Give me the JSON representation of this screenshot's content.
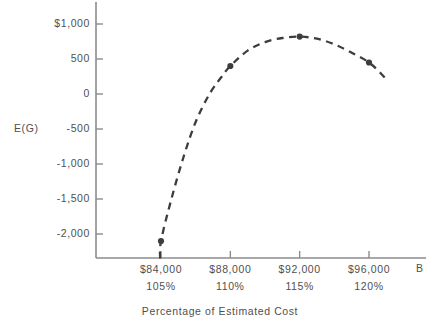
{
  "chart_data": {
    "type": "line",
    "title": "",
    "subtitle": "",
    "xlabel": "Percentage of Estimated Cost",
    "ylabel": "E(G)",
    "x_axis_symbol": "B",
    "grid": false,
    "legend": "none",
    "line_style": "dashed",
    "marker": "filled-circle",
    "xlim": [
      82000,
      98600
    ],
    "ylim": [
      -2350,
      1150
    ],
    "x_ticks": [
      84000,
      88000,
      92000,
      96000
    ],
    "x_tick_labels": [
      "$84,000",
      "$88,000",
      "$92,000",
      "$96,000"
    ],
    "x_tick_sublabels": [
      "105%",
      "110%",
      "115%",
      "120%"
    ],
    "y_ticks": [
      1000,
      500,
      0,
      -500,
      -1000,
      -1500,
      -2000
    ],
    "y_tick_labels": [
      "$1,000",
      "500",
      "0",
      "-500",
      "-1,000",
      "-1,500",
      "-2,000"
    ],
    "x": [
      84000,
      88000,
      92000,
      96000
    ],
    "values": [
      -2100,
      400,
      820,
      450
    ],
    "series": [
      {
        "name": "E(G)",
        "points": [
          {
            "x": 84000,
            "y": -2100,
            "x_label": "$84,000",
            "x_pct": "105%"
          },
          {
            "x": 88000,
            "y": 400,
            "x_label": "$88,000",
            "x_pct": "110%"
          },
          {
            "x": 92000,
            "y": 820,
            "x_label": "$92,000",
            "x_pct": "115%"
          },
          {
            "x": 96000,
            "y": 450,
            "x_label": "$96,000",
            "x_pct": "120%"
          }
        ]
      }
    ],
    "curve_path_points": [
      {
        "x": 83950,
        "y": -2350
      },
      {
        "x": 84000,
        "y": -2100
      },
      {
        "x": 84600,
        "y": -1500
      },
      {
        "x": 85300,
        "y": -900
      },
      {
        "x": 86000,
        "y": -400
      },
      {
        "x": 86800,
        "y": 0
      },
      {
        "x": 87600,
        "y": 280
      },
      {
        "x": 88000,
        "y": 400
      },
      {
        "x": 89000,
        "y": 620
      },
      {
        "x": 90000,
        "y": 740
      },
      {
        "x": 91000,
        "y": 800
      },
      {
        "x": 92000,
        "y": 820
      },
      {
        "x": 93000,
        "y": 790
      },
      {
        "x": 94000,
        "y": 710
      },
      {
        "x": 95000,
        "y": 590
      },
      {
        "x": 96000,
        "y": 450
      },
      {
        "x": 96700,
        "y": 290
      },
      {
        "x": 97100,
        "y": 180
      }
    ],
    "colors": {
      "curve": "#3d3d3d",
      "marker": "#3d3d3d",
      "axis": "#8c8c8c",
      "text": "#4f4f4f",
      "background": "#ffffff"
    }
  }
}
